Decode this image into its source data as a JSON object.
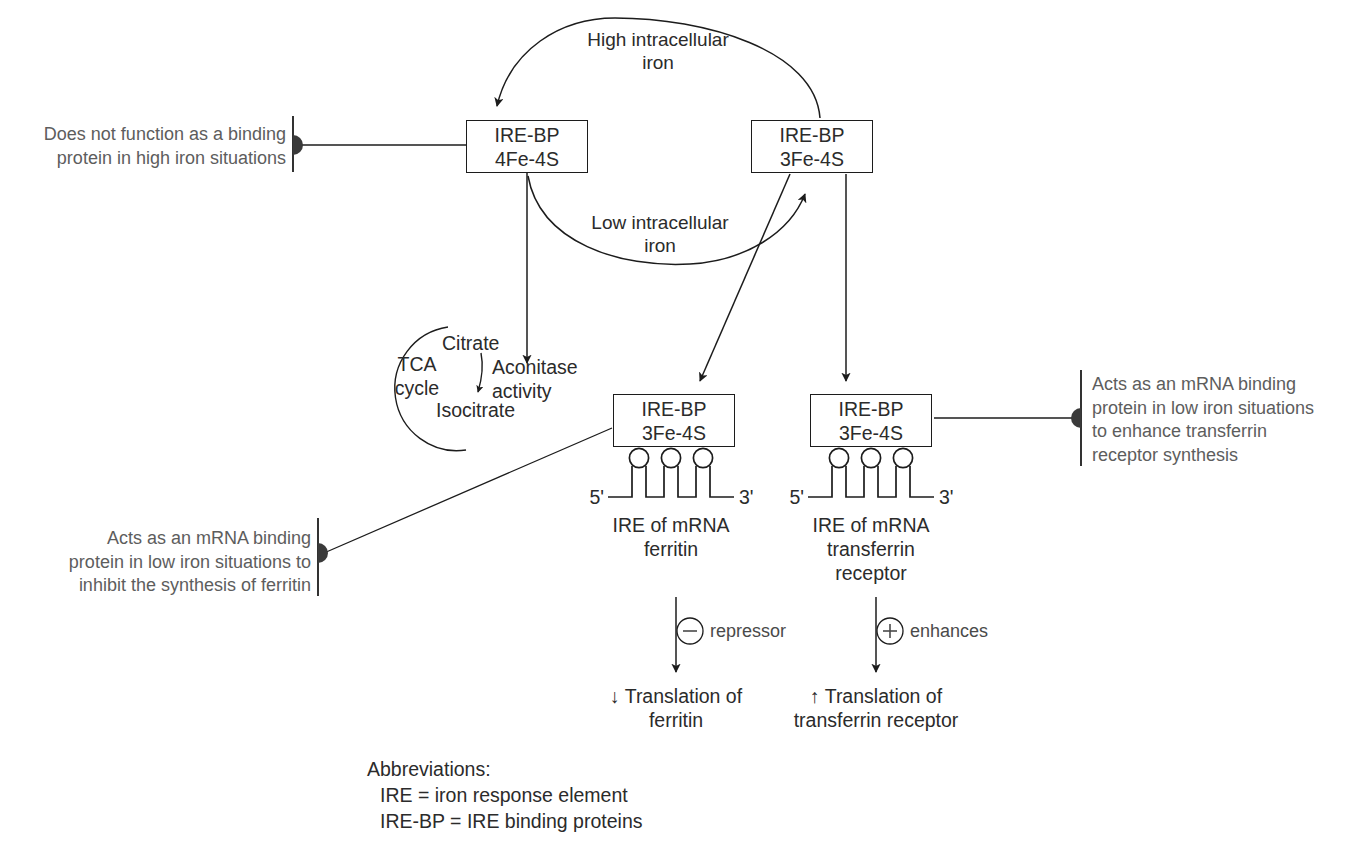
{
  "figure": {
    "title_note": "Regulation of ferritin and transferrin receptor translation by IRE-BP",
    "ink_color": "#1c1c1c",
    "text_color": "#2b2b2b",
    "note_color": "#5d5d5d"
  },
  "boxes": {
    "high_iron": {
      "line1": "IRE-BP",
      "line2": "4Fe-4S"
    },
    "low_iron": {
      "line1": "IRE-BP",
      "line2": "3Fe-4S"
    },
    "ferritin_bound": {
      "line1": "IRE-BP",
      "line2": "3Fe-4S"
    },
    "transferrin_bound": {
      "line1": "IRE-BP",
      "line2": "3Fe-4S"
    }
  },
  "cycle_labels": {
    "top": "High intracellular\niron",
    "bottom": "Low intracellular\niron"
  },
  "tca": {
    "center": "TCA\ncycle",
    "citrate": "Citrate",
    "isocitrate": "Isocitrate",
    "aconitase": "Aconitase\nactivity"
  },
  "mrna": {
    "ferritin": {
      "five_prime": "5'",
      "three_prime": "3'",
      "caption": "IRE of mRNA\nferritin"
    },
    "transferrin": {
      "five_prime": "5'",
      "three_prime": "3'",
      "caption": "IRE of mRNA\ntransferrin\nreceptor"
    }
  },
  "effects": {
    "repressor": {
      "symbol": "−",
      "label": "repressor"
    },
    "enhances": {
      "symbol": "+",
      "label": "enhances"
    }
  },
  "outcomes": {
    "ferritin": "↓ Translation of\nferritin",
    "transferrin": "↑ Translation of\ntransferrin receptor"
  },
  "annotations": {
    "top_left": "Does not function as a binding\nprotein in high iron situations",
    "bottom_left": "Acts as an mRNA binding\nprotein in low iron situations to\ninhibit the synthesis of ferritin",
    "right": "Acts as an mRNA binding\nprotein in low iron situations\nto enhance transferrin\nreceptor synthesis"
  },
  "abbreviations": {
    "heading": "Abbreviations:",
    "items": [
      "IRE = iron response element",
      "IRE-BP = IRE binding proteins"
    ]
  }
}
